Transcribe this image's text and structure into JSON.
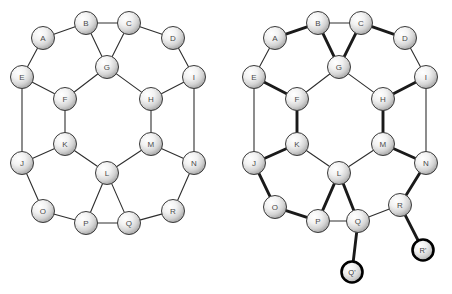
{
  "figure": {
    "background_color": "#ffffff",
    "edge_color": "#2e2e2e",
    "bold_edge_color": "#1a1a1a",
    "node_fill_light": "#ffffff",
    "node_fill_dark": "#9a9a9a",
    "node_stroke": "#3a3a3a",
    "marked_node_stroke": "#000000",
    "label_color": "#4a4a4a",
    "node_radius": 11.5,
    "marked_node_radius": 10.5
  },
  "diagrams": [
    {
      "id": "left-graph",
      "name": "base-graph",
      "nodes": [
        {
          "id": "A",
          "label": "A",
          "x": 43,
          "y": 38,
          "marked": false
        },
        {
          "id": "B",
          "label": "B",
          "x": 86,
          "y": 23,
          "marked": false
        },
        {
          "id": "C",
          "label": "C",
          "x": 129,
          "y": 23,
          "marked": false
        },
        {
          "id": "D",
          "label": "D",
          "x": 173,
          "y": 38,
          "marked": false
        },
        {
          "id": "E",
          "label": "E",
          "x": 22,
          "y": 77,
          "marked": false
        },
        {
          "id": "F",
          "label": "F",
          "x": 65,
          "y": 99,
          "marked": false
        },
        {
          "id": "G",
          "label": "G",
          "x": 107,
          "y": 67,
          "marked": false
        },
        {
          "id": "H",
          "label": "H",
          "x": 151,
          "y": 99,
          "marked": false
        },
        {
          "id": "I",
          "label": "I",
          "x": 194,
          "y": 77,
          "marked": false
        },
        {
          "id": "J",
          "label": "J",
          "x": 22,
          "y": 163,
          "marked": false
        },
        {
          "id": "K",
          "label": "K",
          "x": 65,
          "y": 144,
          "marked": false
        },
        {
          "id": "L",
          "label": "L",
          "x": 107,
          "y": 173,
          "marked": false
        },
        {
          "id": "M",
          "label": "M",
          "x": 151,
          "y": 144,
          "marked": false
        },
        {
          "id": "N",
          "label": "N",
          "x": 194,
          "y": 163,
          "marked": false
        },
        {
          "id": "O",
          "label": "O",
          "x": 43,
          "y": 211,
          "marked": false
        },
        {
          "id": "P",
          "label": "P",
          "x": 86,
          "y": 223,
          "marked": false
        },
        {
          "id": "Q",
          "label": "Q",
          "x": 129,
          "y": 223,
          "marked": false
        },
        {
          "id": "R",
          "label": "R",
          "x": 173,
          "y": 211,
          "marked": false
        }
      ],
      "edges": [
        {
          "from": "A",
          "to": "B",
          "bold": false
        },
        {
          "from": "B",
          "to": "C",
          "bold": false
        },
        {
          "from": "C",
          "to": "D",
          "bold": false
        },
        {
          "from": "A",
          "to": "E",
          "bold": false
        },
        {
          "from": "D",
          "to": "I",
          "bold": false
        },
        {
          "from": "B",
          "to": "G",
          "bold": false
        },
        {
          "from": "C",
          "to": "G",
          "bold": false
        },
        {
          "from": "E",
          "to": "F",
          "bold": false
        },
        {
          "from": "F",
          "to": "G",
          "bold": false
        },
        {
          "from": "G",
          "to": "H",
          "bold": false
        },
        {
          "from": "H",
          "to": "I",
          "bold": false
        },
        {
          "from": "E",
          "to": "J",
          "bold": false
        },
        {
          "from": "I",
          "to": "N",
          "bold": false
        },
        {
          "from": "F",
          "to": "K",
          "bold": false
        },
        {
          "from": "H",
          "to": "M",
          "bold": false
        },
        {
          "from": "J",
          "to": "K",
          "bold": false
        },
        {
          "from": "K",
          "to": "L",
          "bold": false
        },
        {
          "from": "L",
          "to": "M",
          "bold": false
        },
        {
          "from": "M",
          "to": "N",
          "bold": false
        },
        {
          "from": "J",
          "to": "O",
          "bold": false
        },
        {
          "from": "N",
          "to": "R",
          "bold": false
        },
        {
          "from": "L",
          "to": "P",
          "bold": false
        },
        {
          "from": "L",
          "to": "Q",
          "bold": false
        },
        {
          "from": "O",
          "to": "P",
          "bold": false
        },
        {
          "from": "P",
          "to": "Q",
          "bold": false
        },
        {
          "from": "Q",
          "to": "R",
          "bold": false
        }
      ]
    },
    {
      "id": "right-graph",
      "name": "matched-graph-with-pendants",
      "nodes": [
        {
          "id": "A",
          "label": "A",
          "x": 275,
          "y": 38,
          "marked": false
        },
        {
          "id": "B",
          "label": "B",
          "x": 318,
          "y": 23,
          "marked": false
        },
        {
          "id": "C",
          "label": "C",
          "x": 361,
          "y": 23,
          "marked": false
        },
        {
          "id": "D",
          "label": "D",
          "x": 405,
          "y": 38,
          "marked": false
        },
        {
          "id": "E",
          "label": "E",
          "x": 254,
          "y": 77,
          "marked": false
        },
        {
          "id": "F",
          "label": "F",
          "x": 297,
          "y": 99,
          "marked": false
        },
        {
          "id": "G",
          "label": "G",
          "x": 339,
          "y": 67,
          "marked": false
        },
        {
          "id": "H",
          "label": "H",
          "x": 383,
          "y": 99,
          "marked": false
        },
        {
          "id": "I",
          "label": "I",
          "x": 426,
          "y": 77,
          "marked": false
        },
        {
          "id": "J",
          "label": "J",
          "x": 254,
          "y": 163,
          "marked": false
        },
        {
          "id": "K",
          "label": "K",
          "x": 297,
          "y": 144,
          "marked": false
        },
        {
          "id": "L",
          "label": "L",
          "x": 339,
          "y": 173,
          "marked": false
        },
        {
          "id": "M",
          "label": "M",
          "x": 383,
          "y": 144,
          "marked": false
        },
        {
          "id": "N",
          "label": "N",
          "x": 426,
          "y": 163,
          "marked": false
        },
        {
          "id": "O",
          "label": "O",
          "x": 275,
          "y": 207,
          "marked": false
        },
        {
          "id": "P",
          "label": "P",
          "x": 318,
          "y": 221,
          "marked": false
        },
        {
          "id": "Q",
          "label": "Q",
          "x": 358,
          "y": 221,
          "marked": false
        },
        {
          "id": "R",
          "label": "R",
          "x": 400,
          "y": 205,
          "marked": false
        },
        {
          "id": "Q2",
          "label": "Q'",
          "x": 352,
          "y": 272,
          "marked": true
        },
        {
          "id": "R2",
          "label": "R'",
          "x": 423,
          "y": 250,
          "marked": true
        }
      ],
      "edges": [
        {
          "from": "A",
          "to": "B",
          "bold": true
        },
        {
          "from": "B",
          "to": "C",
          "bold": false
        },
        {
          "from": "C",
          "to": "D",
          "bold": true
        },
        {
          "from": "A",
          "to": "E",
          "bold": false
        },
        {
          "from": "D",
          "to": "I",
          "bold": false
        },
        {
          "from": "B",
          "to": "G",
          "bold": true
        },
        {
          "from": "C",
          "to": "G",
          "bold": true
        },
        {
          "from": "E",
          "to": "F",
          "bold": true
        },
        {
          "from": "F",
          "to": "G",
          "bold": false
        },
        {
          "from": "G",
          "to": "H",
          "bold": false
        },
        {
          "from": "H",
          "to": "I",
          "bold": true
        },
        {
          "from": "E",
          "to": "J",
          "bold": false
        },
        {
          "from": "I",
          "to": "N",
          "bold": false
        },
        {
          "from": "F",
          "to": "K",
          "bold": true
        },
        {
          "from": "H",
          "to": "M",
          "bold": true
        },
        {
          "from": "J",
          "to": "K",
          "bold": true
        },
        {
          "from": "K",
          "to": "L",
          "bold": false
        },
        {
          "from": "L",
          "to": "M",
          "bold": false
        },
        {
          "from": "M",
          "to": "N",
          "bold": true
        },
        {
          "from": "J",
          "to": "O",
          "bold": true
        },
        {
          "from": "N",
          "to": "R",
          "bold": true
        },
        {
          "from": "L",
          "to": "P",
          "bold": true
        },
        {
          "from": "L",
          "to": "Q",
          "bold": true
        },
        {
          "from": "O",
          "to": "P",
          "bold": true
        },
        {
          "from": "P",
          "to": "Q",
          "bold": false
        },
        {
          "from": "Q",
          "to": "R",
          "bold": false
        },
        {
          "from": "Q",
          "to": "Q2",
          "bold": true
        },
        {
          "from": "R",
          "to": "R2",
          "bold": true
        }
      ]
    }
  ]
}
